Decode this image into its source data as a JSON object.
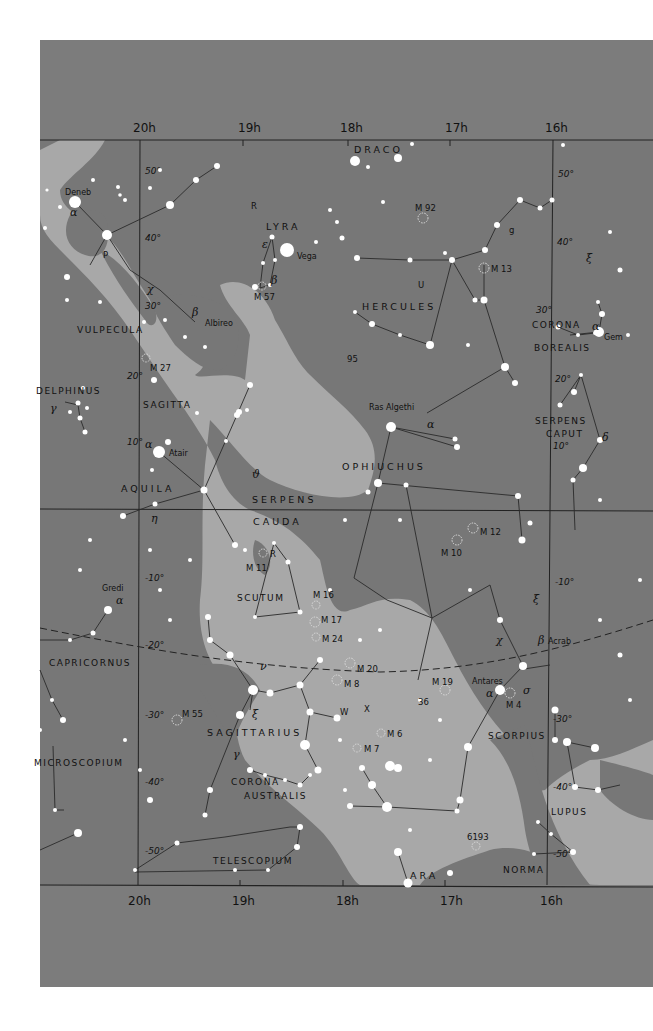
{
  "map": {
    "title": "Star chart: RA 16h–20h, Dec +55° to −55°",
    "colors": {
      "sky": "#7a7a7a",
      "milky_way": "#a9a9a9",
      "outer_frame": "#7c7c7c",
      "page": "#ffffff",
      "stars": "#ffffff",
      "lines": "#2a2a2a"
    },
    "ra_labels_top": [
      "20h",
      "19h",
      "18h",
      "17h",
      "16h"
    ],
    "ra_labels_bottom": [
      "20h",
      "19h",
      "18h",
      "17h",
      "16h"
    ],
    "dec_labels_20h": [
      "50°",
      "40°",
      "30°",
      "20°",
      "10°",
      "-10°",
      "-20°",
      "-30°",
      "-40°",
      "-50°"
    ],
    "dec_labels_16h": [
      "50°",
      "40°",
      "30°",
      "20°",
      "10°",
      "-10°",
      "-30°",
      "-40°",
      "-50°"
    ],
    "constellations": [
      "DRACO",
      "LYRA",
      "HERCULES",
      "VULPECULA",
      "CORONA",
      "BOREALIS",
      "DELPHINUS",
      "SAGITTA",
      "SERPENS",
      "CAPUT",
      "AQUILA",
      "OPHIUCHUS",
      "SERPENS",
      "CAUDA",
      "SCUTUM",
      "CAPRICORNUS",
      "SAGITTARIUS",
      "SCORPIUS",
      "MICROSCOPIUM",
      "CORONA",
      "AUSTRALIS",
      "LUPUS",
      "TELESCOPIUM",
      "NORMA",
      "ARA"
    ],
    "star_names": [
      "Deneb",
      "Vega",
      "Albireo",
      "Atair",
      "Ras Algethi",
      "Gem",
      "Gredi",
      "Antares",
      "Acrab"
    ],
    "greek_labels": [
      "α",
      "ε",
      "β",
      "χ",
      "β",
      "α",
      "γ",
      "α",
      "ϑ",
      "η",
      "α",
      "δ",
      "ξ",
      "α",
      "ν",
      "ξ",
      "γ",
      "χ",
      "β",
      "α",
      "σ",
      "ξ"
    ],
    "deep_sky_objects": [
      "M 92",
      "M 13",
      "M 57",
      "M 27",
      "M 11",
      "M 16",
      "M 17",
      "M 24",
      "M 20",
      "M 8",
      "M 19",
      "M 4",
      "M 55",
      "M 6",
      "M 7",
      "M 10",
      "M 12",
      "6193"
    ],
    "variable_stars": [
      "R",
      "R",
      "U",
      "P",
      "g",
      "W",
      "X",
      "95",
      "36"
    ],
    "ecliptic": "dashed line from left edge (−17°) curving to right edge (−22°)"
  }
}
